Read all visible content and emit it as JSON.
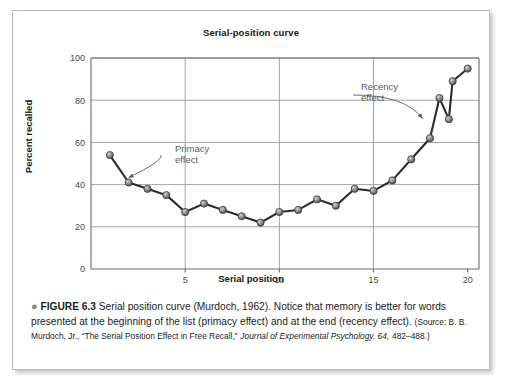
{
  "figure": {
    "bullet": "●",
    "label": "FIGURE 6.3",
    "caption_main": "Serial position curve (Murdoch, 1962). Notice that memory is better for words presented at the beginning of the list (primacy effect) and at the end (recency effect).",
    "source_prefix": "(Source: B. B. Murdoch, Jr., “The Serial Position Effect in Free Recall,”",
    "source_journal": "Journal of Experimental Psychology, 64,",
    "source_pages": "482–488.)"
  },
  "colors": {
    "line": "#2b2b2b",
    "marker_fill": "#8a8a8a",
    "marker_edge": "#3a3a3a",
    "grid": "#9a9a9a",
    "axis": "#6a6a6a",
    "annotation": "#5a5a5a",
    "frame": "#b9b9b9"
  },
  "chart_data": {
    "type": "line",
    "title": "Serial-position curve",
    "xlabel": "Serial position",
    "ylabel": "Percent recalled",
    "xlim": [
      0,
      20.6
    ],
    "ylim": [
      0,
      100
    ],
    "grid": true,
    "legend": "none",
    "x_tick_labels": [
      "5",
      "10",
      "15",
      "20"
    ],
    "x_ticks": [
      5,
      10,
      15,
      20
    ],
    "y_tick_labels": [
      "0",
      "20",
      "40",
      "60",
      "80",
      "100"
    ],
    "y_ticks": [
      0,
      20,
      40,
      60,
      80,
      100
    ],
    "x": [
      1,
      2,
      3,
      4,
      5,
      6,
      7,
      8,
      9,
      10,
      11,
      12,
      13,
      14,
      15,
      16,
      17,
      18,
      19,
      20
    ],
    "values": [
      54,
      41,
      38,
      35,
      27,
      31,
      28,
      25,
      22,
      27,
      28,
      33,
      30,
      38,
      37,
      42,
      52,
      62,
      71,
      95
    ],
    "series": [
      {
        "name": "Percent recalled",
        "values": [
          54,
          41,
          38,
          35,
          27,
          31,
          28,
          25,
          22,
          27,
          28,
          33,
          30,
          38,
          37,
          42,
          52,
          62,
          71,
          95
        ]
      }
    ],
    "intermediate_points": [
      {
        "x": 18.5,
        "y": 81
      },
      {
        "x": 19.2,
        "y": 89
      }
    ],
    "annotations": [
      {
        "name": "primacy",
        "line1": "Primacy",
        "line2": "effect",
        "points_to_x": 2,
        "points_to_y": 41
      },
      {
        "name": "recency",
        "line1": "Recency",
        "line2": "effect",
        "points_to_x": 17.6,
        "points_to_y": 69
      }
    ]
  }
}
